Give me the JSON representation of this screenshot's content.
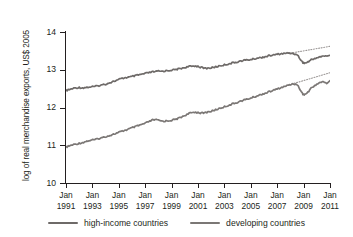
{
  "chart_data": {
    "type": "line",
    "title": "",
    "xlabel": "",
    "ylabel": "log of real merchandise exports, US$ 2005",
    "ylim": [
      10,
      14
    ],
    "yticks": [
      10,
      11,
      12,
      13,
      14
    ],
    "ytick_labels": [
      "10",
      "11",
      "12",
      "13",
      "14"
    ],
    "xlim": [
      1991.0,
      2011.0
    ],
    "xticks": [
      1991,
      1993,
      1995,
      1997,
      1999,
      2001,
      2003,
      2005,
      2007,
      2009,
      2011
    ],
    "xtick_labels": [
      {
        "month": "Jan",
        "year": "1991"
      },
      {
        "month": "Jan",
        "year": "1993"
      },
      {
        "month": "Jan",
        "year": "1995"
      },
      {
        "month": "Jan",
        "year": "1997"
      },
      {
        "month": "Jan",
        "year": "1999"
      },
      {
        "month": "Jan",
        "year": "2001"
      },
      {
        "month": "Jan",
        "year": "2003"
      },
      {
        "month": "Jan",
        "year": "2005"
      },
      {
        "month": "Jan",
        "year": "2007"
      },
      {
        "month": "Jan",
        "year": "2009"
      },
      {
        "month": "Jan",
        "year": "2011"
      }
    ],
    "grid": false,
    "legend_position": "bottom",
    "series": [
      {
        "name": "high-income countries",
        "color": "#6e6a68",
        "x": [
          1991.0,
          1991.25,
          1991.5,
          1991.75,
          1992.0,
          1992.25,
          1992.5,
          1992.75,
          1993.0,
          1993.25,
          1993.5,
          1993.75,
          1994.0,
          1994.25,
          1994.5,
          1994.75,
          1995.0,
          1995.25,
          1995.5,
          1995.75,
          1996.0,
          1996.25,
          1996.5,
          1996.75,
          1997.0,
          1997.25,
          1997.5,
          1997.75,
          1998.0,
          1998.25,
          1998.5,
          1998.75,
          1999.0,
          1999.25,
          1999.5,
          1999.75,
          2000.0,
          2000.25,
          2000.5,
          2000.75,
          2001.0,
          2001.25,
          2001.5,
          2001.75,
          2002.0,
          2002.25,
          2002.5,
          2002.75,
          2003.0,
          2003.25,
          2003.5,
          2003.75,
          2004.0,
          2004.25,
          2004.5,
          2004.75,
          2005.0,
          2005.25,
          2005.5,
          2005.75,
          2006.0,
          2006.25,
          2006.5,
          2006.75,
          2007.0,
          2007.25,
          2007.5,
          2007.75,
          2008.0,
          2008.25,
          2008.4,
          2008.6,
          2008.75,
          2008.9,
          2009.0,
          2009.1,
          2009.25,
          2009.4,
          2009.5,
          2009.75,
          2010.0,
          2010.25,
          2010.5,
          2010.75,
          2011.0
        ],
        "y": [
          12.45,
          12.47,
          12.5,
          12.52,
          12.53,
          12.52,
          12.53,
          12.54,
          12.55,
          12.56,
          12.58,
          12.6,
          12.62,
          12.65,
          12.68,
          12.71,
          12.74,
          12.77,
          12.79,
          12.8,
          12.82,
          12.84,
          12.86,
          12.88,
          12.9,
          12.92,
          12.94,
          12.95,
          12.96,
          12.96,
          12.97,
          12.98,
          12.99,
          13.0,
          13.02,
          13.04,
          13.06,
          13.08,
          13.09,
          13.1,
          13.09,
          13.06,
          13.04,
          13.04,
          13.05,
          13.07,
          13.09,
          13.11,
          13.13,
          13.15,
          13.17,
          13.19,
          13.21,
          13.23,
          13.25,
          13.26,
          13.27,
          13.29,
          13.31,
          13.32,
          13.34,
          13.36,
          13.38,
          13.39,
          13.41,
          13.42,
          13.43,
          13.44,
          13.44,
          13.43,
          13.41,
          13.36,
          13.28,
          13.21,
          13.18,
          13.18,
          13.19,
          13.22,
          13.25,
          13.29,
          13.32,
          13.34,
          13.36,
          13.37,
          13.38
        ]
      },
      {
        "name": "developing countries",
        "color": "#7b7775",
        "x": [
          1991.0,
          1991.25,
          1991.5,
          1991.75,
          1992.0,
          1992.25,
          1992.5,
          1992.75,
          1993.0,
          1993.25,
          1993.5,
          1993.75,
          1994.0,
          1994.25,
          1994.5,
          1994.75,
          1995.0,
          1995.25,
          1995.5,
          1995.75,
          1996.0,
          1996.25,
          1996.5,
          1996.75,
          1997.0,
          1997.25,
          1997.5,
          1997.75,
          1998.0,
          1998.25,
          1998.5,
          1998.75,
          1999.0,
          1999.25,
          1999.5,
          1999.75,
          2000.0,
          2000.25,
          2000.5,
          2000.75,
          2001.0,
          2001.25,
          2001.5,
          2001.75,
          2002.0,
          2002.25,
          2002.5,
          2002.75,
          2003.0,
          2003.25,
          2003.5,
          2003.75,
          2004.0,
          2004.25,
          2004.5,
          2004.75,
          2005.0,
          2005.25,
          2005.5,
          2005.75,
          2006.0,
          2006.25,
          2006.5,
          2006.75,
          2007.0,
          2007.25,
          2007.5,
          2007.75,
          2008.0,
          2008.25,
          2008.4,
          2008.6,
          2008.75,
          2008.9,
          2009.0,
          2009.1,
          2009.25,
          2009.4,
          2009.5,
          2009.75,
          2010.0,
          2010.25,
          2010.5,
          2010.75,
          2011.0
        ],
        "y": [
          10.95,
          10.98,
          11.01,
          11.03,
          11.05,
          11.07,
          11.1,
          11.12,
          11.14,
          11.15,
          11.18,
          11.2,
          11.23,
          11.25,
          11.28,
          11.31,
          11.34,
          11.37,
          11.4,
          11.43,
          11.46,
          11.49,
          11.52,
          11.55,
          11.58,
          11.62,
          11.66,
          11.68,
          11.66,
          11.64,
          11.64,
          11.65,
          11.66,
          11.68,
          11.71,
          11.75,
          11.79,
          11.83,
          11.86,
          11.88,
          11.87,
          11.85,
          11.86,
          11.88,
          11.9,
          11.93,
          11.96,
          11.99,
          12.02,
          12.05,
          12.08,
          12.11,
          12.14,
          12.17,
          12.2,
          12.22,
          12.25,
          12.28,
          12.31,
          12.34,
          12.37,
          12.4,
          12.43,
          12.46,
          12.49,
          12.52,
          12.55,
          12.58,
          12.61,
          12.63,
          12.62,
          12.56,
          12.47,
          12.38,
          12.34,
          12.35,
          12.38,
          12.43,
          12.49,
          12.56,
          12.62,
          12.66,
          12.68,
          12.64,
          12.71
        ]
      }
    ],
    "trend_lines": [
      {
        "name": "high-income-trend",
        "style": "dotted",
        "color": "#9b9796",
        "x": [
          2008.0,
          2011.0
        ],
        "y": [
          13.44,
          13.62
        ]
      },
      {
        "name": "developing-trend",
        "style": "dotted",
        "color": "#9b9796",
        "x": [
          2007.9,
          2011.0
        ],
        "y": [
          12.6,
          12.92
        ]
      }
    ]
  },
  "legend": {
    "items": [
      {
        "label": "high-income countries",
        "color": "#6e6a68"
      },
      {
        "label": "developing countries",
        "color": "#7b7775"
      }
    ]
  },
  "axes": {
    "y_title": "log of real merchandise exports, US$ 2005"
  }
}
